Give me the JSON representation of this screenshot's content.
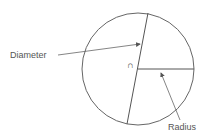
{
  "diagram": {
    "type": "circle-anatomy",
    "labels": {
      "diameter": "Diameter",
      "radius": "Radius",
      "center_symbol": "∩"
    },
    "colors": {
      "stroke": "#555555",
      "text": "#555555",
      "background": "#ffffff"
    },
    "circle": {
      "cx": 138,
      "cy": 69,
      "r": 56
    },
    "diameter_line": {
      "x1": 148,
      "y1": 13,
      "x2": 127,
      "y2": 124
    },
    "radius_line": {
      "x1": 138,
      "y1": 69,
      "x2": 194,
      "y2": 69
    }
  }
}
